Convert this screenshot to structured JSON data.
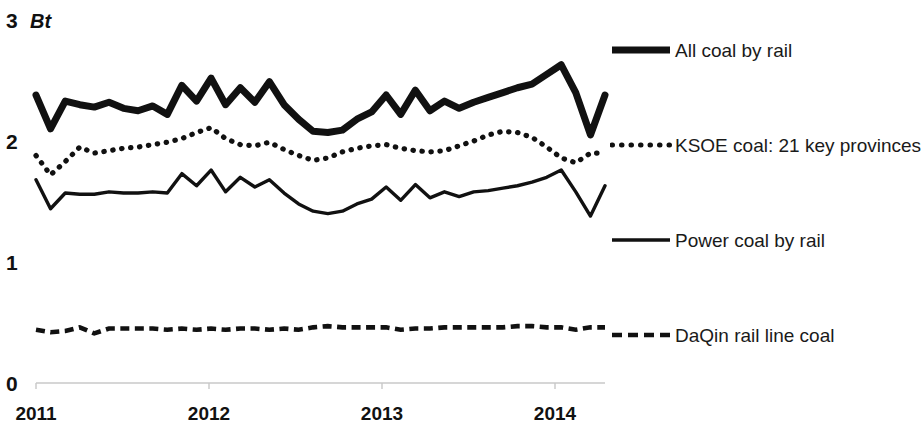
{
  "chart_data": {
    "type": "line",
    "title": "",
    "subtitle": "",
    "xlabel": "",
    "ylabel": "Bt",
    "unit_label": "Bt",
    "grid": false,
    "legend_position": "right",
    "xlim": [
      2011.0,
      2014.25
    ],
    "ylim": [
      0,
      3
    ],
    "yticks": [
      0,
      1,
      2,
      3
    ],
    "ytick_labels": [
      "0",
      "1",
      "2",
      "3"
    ],
    "xticks": [
      2011,
      2012,
      2013,
      2014
    ],
    "xtick_labels": [
      "2011",
      "2012",
      "2013",
      "2014"
    ],
    "x": [
      2011.0,
      2011.083,
      2011.167,
      2011.25,
      2011.333,
      2011.417,
      2011.5,
      2011.583,
      2011.667,
      2011.75,
      2011.833,
      2011.917,
      2012.0,
      2012.083,
      2012.167,
      2012.25,
      2012.333,
      2012.417,
      2012.5,
      2012.583,
      2012.667,
      2012.75,
      2012.833,
      2012.917,
      2013.0,
      2013.083,
      2013.167,
      2013.25,
      2013.333,
      2013.417,
      2013.5,
      2013.583,
      2013.667,
      2013.75,
      2013.833,
      2013.917,
      2014.0,
      2014.083,
      2014.167,
      2014.25
    ],
    "series": [
      {
        "name": "All coal by rail",
        "style": "solid-thick",
        "color": "#111111",
        "values": [
          2.38,
          2.1,
          2.33,
          2.3,
          2.28,
          2.32,
          2.27,
          2.25,
          2.29,
          2.22,
          2.46,
          2.33,
          2.52,
          2.3,
          2.44,
          2.32,
          2.49,
          2.3,
          2.18,
          2.08,
          2.07,
          2.09,
          2.18,
          2.24,
          2.38,
          2.22,
          2.42,
          2.25,
          2.33,
          2.27,
          2.32,
          2.36,
          2.4,
          2.44,
          2.47,
          2.55,
          2.63,
          2.4,
          2.05,
          2.38
        ]
      },
      {
        "name": "KSOE coal: 21 key provinces",
        "style": "dotted",
        "color": "#111111",
        "values": [
          1.88,
          1.72,
          1.83,
          1.95,
          1.9,
          1.92,
          1.94,
          1.95,
          1.97,
          1.99,
          2.02,
          2.07,
          2.11,
          2.02,
          1.97,
          1.96,
          1.99,
          1.93,
          1.88,
          1.84,
          1.86,
          1.91,
          1.94,
          1.96,
          1.97,
          1.94,
          1.92,
          1.91,
          1.92,
          1.96,
          2.0,
          2.05,
          2.08,
          2.07,
          2.03,
          1.95,
          1.86,
          1.82,
          1.9,
          1.9
        ]
      },
      {
        "name": "Power coal by rail",
        "style": "solid-thin",
        "color": "#111111",
        "values": [
          1.68,
          1.44,
          1.57,
          1.56,
          1.56,
          1.58,
          1.57,
          1.57,
          1.58,
          1.57,
          1.73,
          1.63,
          1.76,
          1.58,
          1.7,
          1.62,
          1.68,
          1.57,
          1.48,
          1.42,
          1.4,
          1.42,
          1.48,
          1.52,
          1.62,
          1.51,
          1.64,
          1.53,
          1.58,
          1.54,
          1.58,
          1.59,
          1.61,
          1.63,
          1.66,
          1.7,
          1.76,
          1.58,
          1.38,
          1.63
        ]
      },
      {
        "name": "DaQin rail line coal",
        "style": "dashed",
        "color": "#111111",
        "values": [
          0.44,
          0.42,
          0.43,
          0.46,
          0.41,
          0.45,
          0.45,
          0.45,
          0.45,
          0.44,
          0.45,
          0.44,
          0.45,
          0.44,
          0.45,
          0.45,
          0.44,
          0.45,
          0.44,
          0.46,
          0.47,
          0.46,
          0.46,
          0.46,
          0.46,
          0.44,
          0.45,
          0.45,
          0.46,
          0.46,
          0.46,
          0.46,
          0.46,
          0.47,
          0.47,
          0.46,
          0.46,
          0.44,
          0.46,
          0.46
        ]
      }
    ]
  },
  "axis": {
    "unit": "Bt",
    "y_ticks": [
      "3",
      "2",
      "1",
      "0"
    ],
    "x_ticks": [
      "2011",
      "2012",
      "2013",
      "2014"
    ]
  },
  "legend": {
    "items": [
      {
        "label": "All coal by rail",
        "style": "solid-thick"
      },
      {
        "label": "KSOE coal: 21 key provinces",
        "style": "dotted"
      },
      {
        "label": "Power coal by rail",
        "style": "solid-thin"
      },
      {
        "label": "DaQin rail line coal",
        "style": "dashed"
      }
    ]
  }
}
